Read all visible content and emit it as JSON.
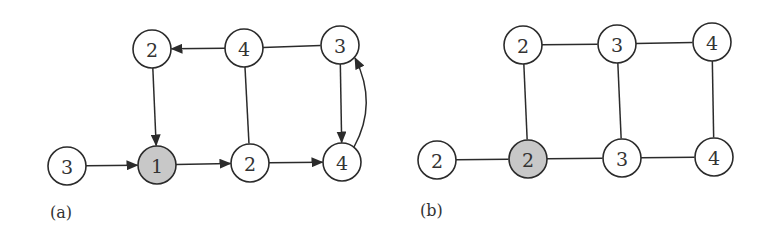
{
  "colors": {
    "node_fill": "#ffffff",
    "node_highlight_fill": "#c8c8c8",
    "stroke": "#2b2b2b",
    "text": "#333333"
  },
  "panels": [
    {
      "id": "a",
      "label": "(a)",
      "label_pos": [
        50,
        218
      ],
      "directed": true,
      "nodes": [
        {
          "id": "a_tl",
          "value": "2",
          "x": 152,
          "y": 49,
          "highlight": false
        },
        {
          "id": "a_tm",
          "value": "4",
          "x": 244,
          "y": 48,
          "highlight": false
        },
        {
          "id": "a_tr",
          "value": "3",
          "x": 340,
          "y": 45,
          "highlight": false
        },
        {
          "id": "a_bl",
          "value": "3",
          "x": 67,
          "y": 166,
          "highlight": false
        },
        {
          "id": "a_b1",
          "value": "1",
          "x": 157,
          "y": 165,
          "highlight": true
        },
        {
          "id": "a_bm",
          "value": "2",
          "x": 250,
          "y": 163,
          "highlight": false
        },
        {
          "id": "a_br",
          "value": "4",
          "x": 342,
          "y": 162,
          "highlight": false
        }
      ],
      "edges": [
        {
          "from": "a_tm",
          "to": "a_tl",
          "arrow": true
        },
        {
          "from": "a_tm",
          "to": "a_tr",
          "arrow": false
        },
        {
          "from": "a_tl",
          "to": "a_b1",
          "arrow": true
        },
        {
          "from": "a_tm",
          "to": "a_bm",
          "arrow": false
        },
        {
          "from": "a_tr",
          "to": "a_br",
          "arrow": true
        },
        {
          "from": "a_bl",
          "to": "a_b1",
          "arrow": true
        },
        {
          "from": "a_b1",
          "to": "a_bm",
          "arrow": true
        },
        {
          "from": "a_bm",
          "to": "a_br",
          "arrow": true
        },
        {
          "from": "a_br",
          "to": "a_tr",
          "arrow": true,
          "curved": true
        }
      ]
    },
    {
      "id": "b",
      "label": "(b)",
      "label_pos": [
        420,
        216
      ],
      "directed": false,
      "nodes": [
        {
          "id": "b_tl",
          "value": "2",
          "x": 523,
          "y": 45,
          "highlight": false
        },
        {
          "id": "b_tm",
          "value": "3",
          "x": 617,
          "y": 44,
          "highlight": false
        },
        {
          "id": "b_tr",
          "value": "4",
          "x": 712,
          "y": 42,
          "highlight": false
        },
        {
          "id": "b_bl",
          "value": "2",
          "x": 437,
          "y": 160,
          "highlight": false
        },
        {
          "id": "b_b2",
          "value": "2",
          "x": 528,
          "y": 159,
          "highlight": true
        },
        {
          "id": "b_bm",
          "value": "3",
          "x": 622,
          "y": 158,
          "highlight": false
        },
        {
          "id": "b_br",
          "value": "4",
          "x": 714,
          "y": 157,
          "highlight": false
        }
      ],
      "edges": [
        {
          "from": "b_tl",
          "to": "b_tm",
          "arrow": false
        },
        {
          "from": "b_tm",
          "to": "b_tr",
          "arrow": false
        },
        {
          "from": "b_tl",
          "to": "b_b2",
          "arrow": false
        },
        {
          "from": "b_tm",
          "to": "b_bm",
          "arrow": false
        },
        {
          "from": "b_tr",
          "to": "b_br",
          "arrow": false
        },
        {
          "from": "b_bl",
          "to": "b_b2",
          "arrow": false
        },
        {
          "from": "b_b2",
          "to": "b_bm",
          "arrow": false
        },
        {
          "from": "b_bm",
          "to": "b_br",
          "arrow": false
        }
      ]
    }
  ],
  "node_radius": 19
}
